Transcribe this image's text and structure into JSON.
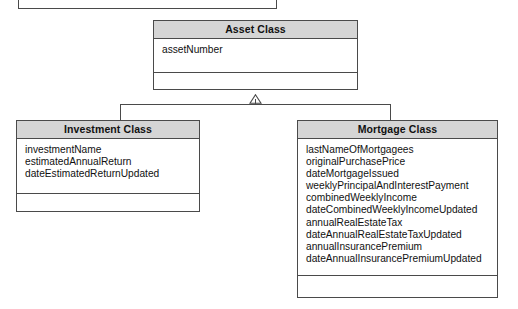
{
  "diagram": {
    "colors": {
      "header_fill": "#d5d5d5",
      "border": "#4a4a4a",
      "body_fill": "#ffffff",
      "text": "#111111"
    },
    "partial_box": {
      "label": ""
    },
    "classes": [
      {
        "id": "asset",
        "name": "Asset Class",
        "attributes": [
          "assetNumber"
        ],
        "operations": []
      },
      {
        "id": "investment",
        "name": "Investment Class",
        "attributes": [
          "investmentName",
          "estimatedAnnualReturn",
          "dateEstimatedReturnUpdated"
        ],
        "operations": []
      },
      {
        "id": "mortgage",
        "name": "Mortgage Class",
        "attributes": [
          "lastNameOfMortgagees",
          "originalPurchasePrice",
          "dateMortgageIssued",
          "weeklyPrincipalAndInterestPayment",
          "combinedWeeklyIncome",
          "dateCombinedWeeklyIncomeUpdated",
          "annualRealEstateTax",
          "dateAnnualRealEstateTaxUpdated",
          "annualInsurancePremium",
          "dateAnnualInsurancePremiumUpdated"
        ],
        "operations": []
      }
    ],
    "relationships": [
      {
        "type": "generalization",
        "notation": "hollow-triangle",
        "parent": "Asset Class",
        "children": [
          "Investment Class",
          "Mortgage Class"
        ]
      }
    ]
  }
}
